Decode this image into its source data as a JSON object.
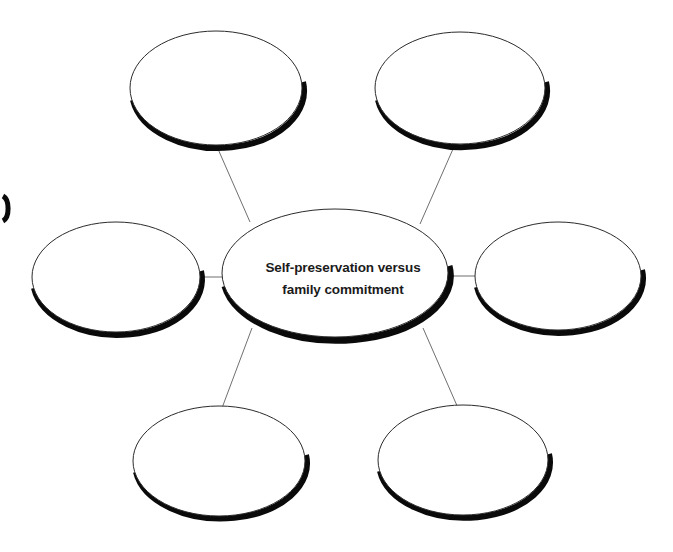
{
  "diagram": {
    "type": "web-organizer",
    "background_color": "#ffffff",
    "outline_color": "#2b2b2b",
    "shadow_color": "#0a0a0a",
    "connector_color": "#6f6f6f",
    "text_color": "#1b1b1b",
    "center_node": {
      "id": "center",
      "label_line_1": "Self-preservation versus",
      "label_line_2": "family commitment",
      "cx": 335,
      "cy": 273,
      "rx": 113,
      "ry": 64
    },
    "satellite_nodes": [
      {
        "id": "top-left",
        "label": "",
        "cx": 216,
        "cy": 88,
        "rx": 86,
        "ry": 57
      },
      {
        "id": "top-right",
        "label": "",
        "cx": 460,
        "cy": 88,
        "rx": 85,
        "ry": 56
      },
      {
        "id": "left",
        "label": "",
        "cx": 116,
        "cy": 277,
        "rx": 84,
        "ry": 55
      },
      {
        "id": "right",
        "label": "",
        "cx": 558,
        "cy": 276,
        "rx": 83,
        "ry": 54
      },
      {
        "id": "bottom-left",
        "label": "",
        "cx": 219,
        "cy": 461,
        "rx": 86,
        "ry": 55
      },
      {
        "id": "bottom-right",
        "label": "",
        "cx": 463,
        "cy": 460,
        "rx": 85,
        "ry": 55
      }
    ],
    "connectors": [
      {
        "id": "center-to-top-left",
        "x1": 250,
        "y1": 222,
        "x2": 218,
        "y2": 149
      },
      {
        "id": "center-to-top-right",
        "x1": 420,
        "y1": 224,
        "x2": 453,
        "y2": 149
      },
      {
        "id": "center-to-left",
        "x1": 225,
        "y1": 277,
        "x2": 199,
        "y2": 277
      },
      {
        "id": "center-to-right",
        "x1": 449,
        "y1": 276,
        "x2": 477,
        "y2": 276
      },
      {
        "id": "center-to-bottom-left",
        "x1": 252,
        "y1": 328,
        "x2": 222,
        "y2": 408
      },
      {
        "id": "center-to-bottom-right",
        "x1": 423,
        "y1": 328,
        "x2": 458,
        "y2": 408
      }
    ],
    "edge_fragment": {
      "id": "left-edge-partial-shape",
      "cx": -2,
      "cy": 208,
      "rx": 7,
      "ry": 13
    }
  }
}
